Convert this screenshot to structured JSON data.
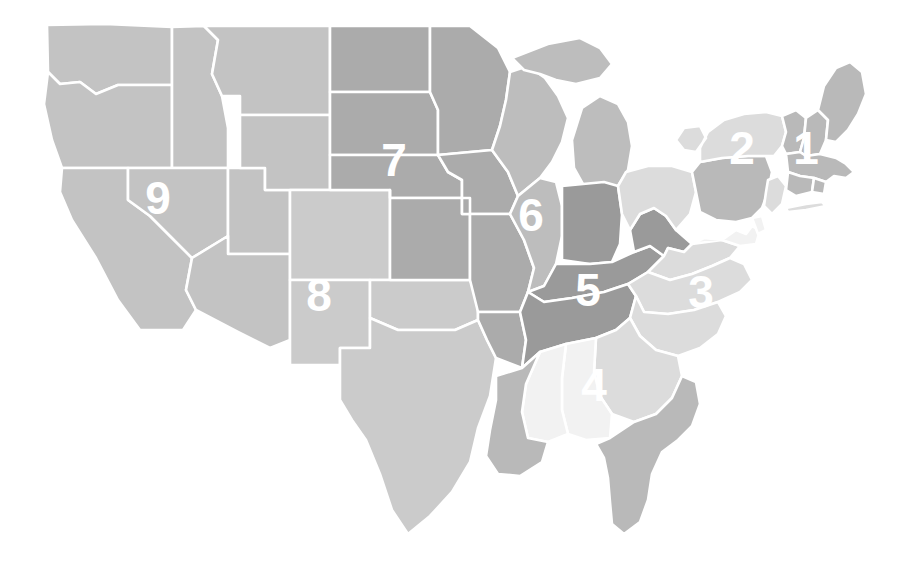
{
  "map": {
    "title": "United States Census Divisions",
    "background_color": "#ffffff",
    "border_color": "#ffffff",
    "label_color": "#ffffff",
    "width": 913,
    "height": 568
  },
  "legend_note": "Nine numbered census divisions shaded by gray value",
  "divisions": [
    {
      "number": "1",
      "name": "New England",
      "color": "#b9b9b9",
      "label_x": 806,
      "label_y": 148
    },
    {
      "number": "2",
      "name": "Middle Atlantic",
      "color": "#b9b9b9",
      "label_x": 742,
      "label_y": 148
    },
    {
      "number": "3",
      "name": "South Atlantic",
      "color": "#dcdcdc",
      "label_x": 701,
      "label_y": 292
    },
    {
      "number": "4",
      "name": "East South Central",
      "color": "#f2f2f2",
      "label_x": 594,
      "label_y": 385
    },
    {
      "number": "5",
      "name": "East North Central",
      "color": "#9a9a9a",
      "label_x": 588,
      "label_y": 290
    },
    {
      "number": "6",
      "name": "West North Central",
      "color": "#bdbdbd",
      "label_x": 531,
      "label_y": 215
    },
    {
      "number": "7",
      "name": "Mountain",
      "color": "#ababab",
      "label_x": 394,
      "label_y": 160
    },
    {
      "number": "8",
      "name": "West South Central",
      "color": "#cbcbcb",
      "label_x": 319,
      "label_y": 295
    },
    {
      "number": "9",
      "name": "Pacific",
      "color": "#c3c3c3",
      "label_x": 158,
      "label_y": 198
    }
  ],
  "colors": {
    "gray_darkest": "#9a9a9a",
    "gray_dark": "#ababab",
    "gray_mid_dark": "#b9b9b9",
    "gray_mid": "#bdbdbd",
    "gray_light": "#c3c3c3",
    "gray_lighter": "#cbcbcb",
    "gray_pale": "#dcdcdc",
    "gray_palest": "#f2f2f2",
    "white": "#ffffff"
  },
  "states": [
    {
      "code": "WA",
      "division": "9",
      "color": "#c3c3c3"
    },
    {
      "code": "OR",
      "division": "9",
      "color": "#c3c3c3"
    },
    {
      "code": "CA",
      "division": "9",
      "color": "#c3c3c3"
    },
    {
      "code": "ID",
      "division": "9",
      "color": "#c3c3c3"
    },
    {
      "code": "NV",
      "division": "9",
      "color": "#c3c3c3"
    },
    {
      "code": "UT",
      "division": "9",
      "color": "#c3c3c3"
    },
    {
      "code": "AZ",
      "division": "9",
      "color": "#c3c3c3"
    },
    {
      "code": "MT",
      "division": "9",
      "color": "#c3c3c3"
    },
    {
      "code": "WY",
      "division": "9",
      "color": "#c3c3c3"
    },
    {
      "code": "CO",
      "division": "8",
      "color": "#cbcbcb"
    },
    {
      "code": "NM",
      "division": "8",
      "color": "#cbcbcb"
    },
    {
      "code": "TX",
      "division": "8",
      "color": "#cbcbcb"
    },
    {
      "code": "OK",
      "division": "8",
      "color": "#cbcbcb"
    },
    {
      "code": "ND",
      "division": "7",
      "color": "#ababab"
    },
    {
      "code": "SD",
      "division": "7",
      "color": "#ababab"
    },
    {
      "code": "NE",
      "division": "7",
      "color": "#ababab"
    },
    {
      "code": "KS",
      "division": "7",
      "color": "#ababab"
    },
    {
      "code": "MN",
      "division": "7",
      "color": "#ababab"
    },
    {
      "code": "IA",
      "division": "7",
      "color": "#ababab"
    },
    {
      "code": "MO",
      "division": "7",
      "color": "#ababab"
    },
    {
      "code": "AR",
      "division": "7",
      "color": "#ababab"
    },
    {
      "code": "WI",
      "division": "6",
      "color": "#bdbdbd"
    },
    {
      "code": "MI",
      "division": "6",
      "color": "#bdbdbd"
    },
    {
      "code": "IL",
      "division": "6",
      "color": "#bdbdbd"
    },
    {
      "code": "IN",
      "division": "5",
      "color": "#9a9a9a"
    },
    {
      "code": "OH",
      "division": "3",
      "color": "#dcdcdc"
    },
    {
      "code": "KY",
      "division": "5",
      "color": "#9a9a9a"
    },
    {
      "code": "TN",
      "division": "5",
      "color": "#9a9a9a"
    },
    {
      "code": "WV",
      "division": "5",
      "color": "#9a9a9a"
    },
    {
      "code": "VA",
      "division": "3",
      "color": "#dcdcdc"
    },
    {
      "code": "NC",
      "division": "3",
      "color": "#dcdcdc"
    },
    {
      "code": "SC",
      "division": "3",
      "color": "#dcdcdc"
    },
    {
      "code": "GA",
      "division": "3",
      "color": "#dcdcdc"
    },
    {
      "code": "FL",
      "division": "4",
      "color": "#f2f2f2"
    },
    {
      "code": "AL",
      "division": "4",
      "color": "#f2f2f2"
    },
    {
      "code": "MS",
      "division": "4",
      "color": "#f2f2f2"
    },
    {
      "code": "LA",
      "division": "4",
      "color": "#f2f2f2"
    },
    {
      "code": "PA",
      "division": "2",
      "color": "#b9b9b9"
    },
    {
      "code": "NY",
      "division": "2",
      "color": "#b9b9b9"
    },
    {
      "code": "NJ",
      "division": "2",
      "color": "#b9b9b9"
    },
    {
      "code": "MD",
      "division": "3",
      "color": "#dcdcdc"
    },
    {
      "code": "DE",
      "division": "3",
      "color": "#dcdcdc"
    },
    {
      "code": "VT",
      "division": "1",
      "color": "#b9b9b9"
    },
    {
      "code": "NH",
      "division": "1",
      "color": "#b9b9b9"
    },
    {
      "code": "ME",
      "division": "1",
      "color": "#b9b9b9"
    },
    {
      "code": "MA",
      "division": "1",
      "color": "#b9b9b9"
    },
    {
      "code": "CT",
      "division": "1",
      "color": "#b9b9b9"
    },
    {
      "code": "RI",
      "division": "1",
      "color": "#b9b9b9"
    }
  ]
}
